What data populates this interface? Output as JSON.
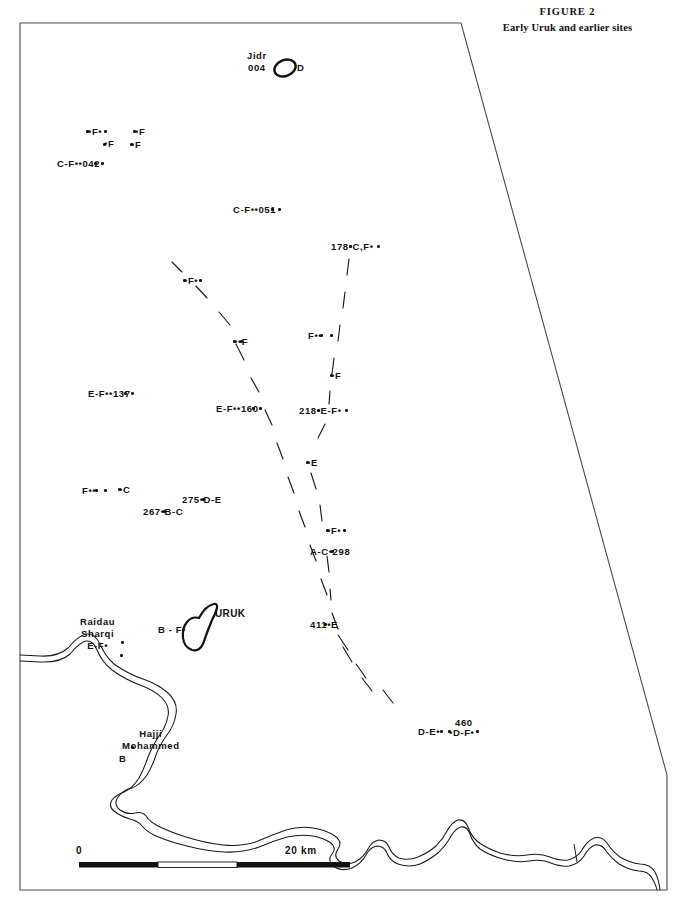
{
  "figure": {
    "title": "FIGURE 2",
    "subtitle": "Early Uruk and earlier sites"
  },
  "map": {
    "border_color": "#4a4a4a",
    "river_color": "#1a1a1a",
    "watercourse_color": "#1a1a1a",
    "site_color": "#111111"
  },
  "scale": {
    "start_label": "0",
    "end_label": "20  km"
  },
  "named_sites": {
    "jidr": "Jidr\n004",
    "jidr_period": "D",
    "uruk": "URUK",
    "uruk_period": "B - F•",
    "raidau": "Raidau\nSharqi\nE-F•",
    "hajji": "Hajji\nMohammed",
    "hajji_period": "B"
  },
  "site_labels": [
    {
      "text": "•F•",
      "x": 88,
      "y": 126
    },
    {
      "text": "•F",
      "x": 135,
      "y": 126
    },
    {
      "text": "•F",
      "x": 104,
      "y": 138
    },
    {
      "text": "•F",
      "x": 131,
      "y": 139
    },
    {
      "text": "C-F••042",
      "x": 57,
      "y": 158
    },
    {
      "text": "C-F••051",
      "x": 233,
      "y": 204
    },
    {
      "text": "178•C,F•",
      "x": 331,
      "y": 241
    },
    {
      "text": "•F•",
      "x": 184,
      "y": 275
    },
    {
      "text": "••F",
      "x": 234,
      "y": 336
    },
    {
      "text": "F••",
      "x": 308,
      "y": 330
    },
    {
      "text": "•F",
      "x": 331,
      "y": 370
    },
    {
      "text": "E-F••137",
      "x": 88,
      "y": 388
    },
    {
      "text": "E-F••160",
      "x": 216,
      "y": 403
    },
    {
      "text": "218•E-F•",
      "x": 299,
      "y": 405
    },
    {
      "text": "•E",
      "x": 307,
      "y": 457
    },
    {
      "text": "F••",
      "x": 82,
      "y": 485
    },
    {
      "text": "•C",
      "x": 119,
      "y": 484
    },
    {
      "text": "275•D-E",
      "x": 182,
      "y": 494
    },
    {
      "text": "267•B-C",
      "x": 143,
      "y": 506
    },
    {
      "text": "•F•",
      "x": 327,
      "y": 525
    },
    {
      "text": "A-C•298",
      "x": 310,
      "y": 546
    },
    {
      "text": "411•E",
      "x": 310,
      "y": 619
    },
    {
      "text": "D-E•",
      "x": 418,
      "y": 726
    },
    {
      "text": "460",
      "x": 455,
      "y": 717
    },
    {
      "text": "•D-F•",
      "x": 449,
      "y": 727
    }
  ],
  "site_dots": [
    {
      "x": 86,
      "y": 130
    },
    {
      "x": 104,
      "y": 130
    },
    {
      "x": 133,
      "y": 130
    },
    {
      "x": 103,
      "y": 143
    },
    {
      "x": 130,
      "y": 143
    },
    {
      "x": 94,
      "y": 162
    },
    {
      "x": 101,
      "y": 162
    },
    {
      "x": 271,
      "y": 208
    },
    {
      "x": 278,
      "y": 208
    },
    {
      "x": 349,
      "y": 245
    },
    {
      "x": 377,
      "y": 245
    },
    {
      "x": 183,
      "y": 279
    },
    {
      "x": 199,
      "y": 279
    },
    {
      "x": 233,
      "y": 340
    },
    {
      "x": 240,
      "y": 340
    },
    {
      "x": 320,
      "y": 334
    },
    {
      "x": 330,
      "y": 334
    },
    {
      "x": 330,
      "y": 374
    },
    {
      "x": 124,
      "y": 392
    },
    {
      "x": 131,
      "y": 392
    },
    {
      "x": 252,
      "y": 407
    },
    {
      "x": 259,
      "y": 407
    },
    {
      "x": 317,
      "y": 409
    },
    {
      "x": 345,
      "y": 409
    },
    {
      "x": 306,
      "y": 461
    },
    {
      "x": 95,
      "y": 489
    },
    {
      "x": 104,
      "y": 489
    },
    {
      "x": 118,
      "y": 488
    },
    {
      "x": 202,
      "y": 498
    },
    {
      "x": 163,
      "y": 510
    },
    {
      "x": 326,
      "y": 529
    },
    {
      "x": 343,
      "y": 529
    },
    {
      "x": 331,
      "y": 550
    },
    {
      "x": 324,
      "y": 623
    },
    {
      "x": 440,
      "y": 730
    },
    {
      "x": 448,
      "y": 730
    },
    {
      "x": 476,
      "y": 730
    },
    {
      "x": 121,
      "y": 641
    },
    {
      "x": 120,
      "y": 654
    },
    {
      "x": 131,
      "y": 746
    }
  ]
}
